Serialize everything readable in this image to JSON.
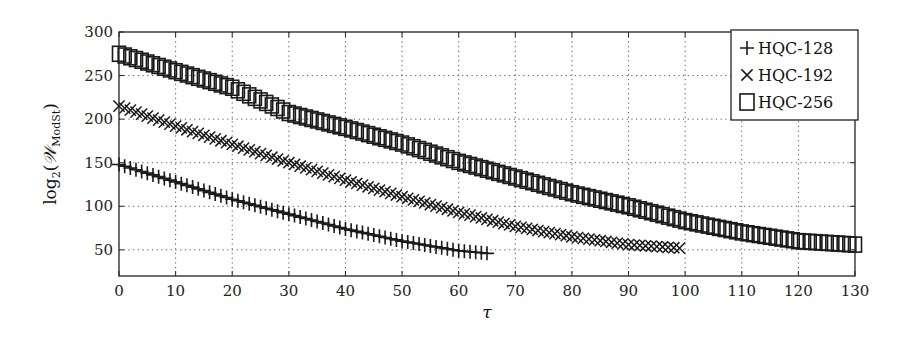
{
  "chart_data": {
    "type": "scatter",
    "title": "",
    "xlabel": "τ",
    "ylabel": "log2(W_ModSt)",
    "ylabel_parts": {
      "func": "log",
      "sub": "2",
      "open": "(",
      "sym": "𝒲",
      "symsub": "ModSt",
      "close": ")"
    },
    "xlim": [
      0,
      130
    ],
    "ylim": [
      20,
      300
    ],
    "xticks": [
      0,
      10,
      20,
      30,
      40,
      50,
      60,
      70,
      80,
      90,
      100,
      110,
      120,
      130
    ],
    "yticks": [
      50,
      100,
      150,
      200,
      250,
      300
    ],
    "grid": true,
    "grid_style": "dotted",
    "legend_position": "top-right",
    "series": [
      {
        "name": "HQC-128",
        "marker": "plus",
        "x_start": 0,
        "x_end": 65,
        "x_step": 1,
        "anchors": [
          [
            0,
            148
          ],
          [
            10,
            128
          ],
          [
            20,
            108
          ],
          [
            30,
            91
          ],
          [
            40,
            74
          ],
          [
            50,
            60
          ],
          [
            60,
            49
          ],
          [
            65,
            46
          ]
        ]
      },
      {
        "name": "HQC-192",
        "marker": "cross",
        "x_start": 0,
        "x_end": 99,
        "x_step": 1,
        "anchors": [
          [
            0,
            215
          ],
          [
            10,
            192
          ],
          [
            20,
            171
          ],
          [
            30,
            150
          ],
          [
            40,
            130
          ],
          [
            50,
            111
          ],
          [
            60,
            93
          ],
          [
            70,
            77
          ],
          [
            80,
            65
          ],
          [
            90,
            56
          ],
          [
            99,
            52
          ]
        ]
      },
      {
        "name": "HQC-256",
        "marker": "square",
        "x_start": 0,
        "x_end": 130,
        "x_step": 1,
        "anchors": [
          [
            0,
            275
          ],
          [
            10,
            255
          ],
          [
            20,
            236
          ],
          [
            30,
            207
          ],
          [
            40,
            190
          ],
          [
            50,
            172
          ],
          [
            60,
            151
          ],
          [
            70,
            133
          ],
          [
            80,
            115
          ],
          [
            90,
            100
          ],
          [
            100,
            83
          ],
          [
            110,
            70
          ],
          [
            120,
            60
          ],
          [
            130,
            56
          ]
        ]
      }
    ]
  }
}
